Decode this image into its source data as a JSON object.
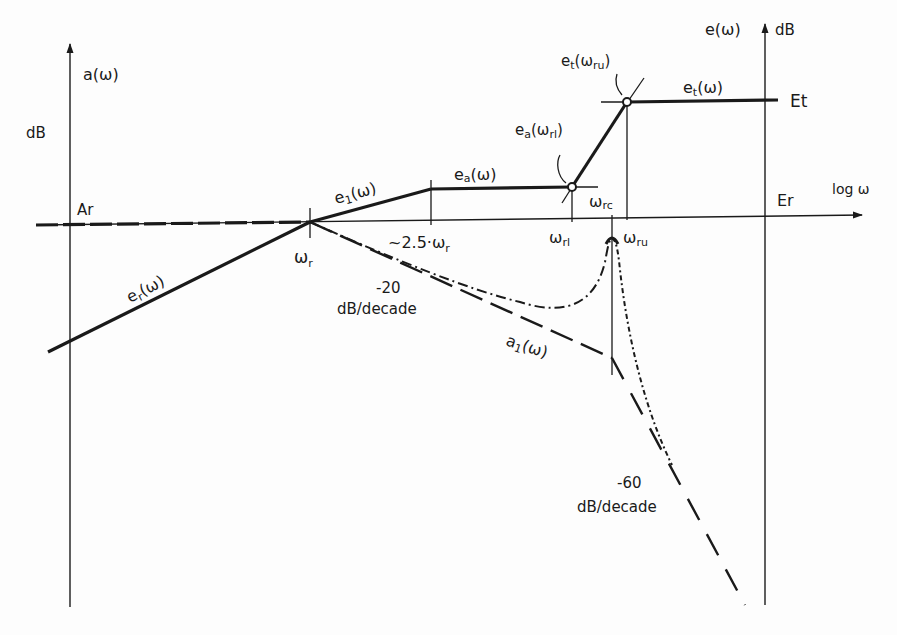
{
  "diagram": {
    "type": "bode-asymptotic-plot",
    "left_axis": {
      "quantity": "a(ω)",
      "unit": "dB",
      "level_label": "Ar"
    },
    "right_axis": {
      "quantity": "e(ω)",
      "unit": "dB",
      "upper_level_label": "Et",
      "lower_level_label": "Er"
    },
    "x_axis": {
      "label": "log ω"
    },
    "frequencies": {
      "w_r": {
        "main": "ω",
        "sub": "r"
      },
      "w_25": {
        "prefix": "~2.5·ω",
        "sub": "r"
      },
      "w_rl": {
        "main": "ω",
        "sub": "rl"
      },
      "w_rc": {
        "main": "ω",
        "sub": "rc"
      },
      "w_ru": {
        "main": "ω",
        "sub": "ru"
      }
    },
    "curves": {
      "er": {
        "main": "e",
        "sub": "r",
        "tail": "(ω)"
      },
      "e1": {
        "main": "e",
        "sub": "1",
        "tail": "(ω)"
      },
      "ea": {
        "main": "e",
        "sub": "a",
        "tail": "(ω)"
      },
      "et": {
        "main": "e",
        "sub": "t",
        "tail": "(ω)"
      },
      "a1": {
        "main": "a",
        "sub": "1",
        "tail": "(ω)"
      }
    },
    "points": {
      "ea_wrl": {
        "main": "e",
        "sub": "a",
        "mid": "(ω",
        "sub2": "rl",
        "tail": ")"
      },
      "et_wru": {
        "main": "e",
        "sub": "t",
        "mid": "(ω",
        "sub2": "ru",
        "tail": ")"
      }
    },
    "slopes": {
      "s20": {
        "value": "-20",
        "unit": "dB/decade"
      },
      "s60": {
        "value": "-60",
        "unit": "dB/decade"
      }
    },
    "colors": {
      "ink": "#1a1a1a",
      "background": "#fdfdfd"
    }
  }
}
